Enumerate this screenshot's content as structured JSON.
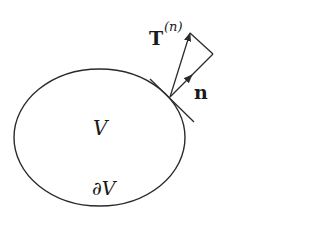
{
  "diagram": {
    "region_label": "V",
    "boundary_label": "∂V",
    "normal_label": "n",
    "traction_label": "T",
    "traction_superscript": "(n)",
    "stroke_color": "#2a2a2a",
    "background": "#ffffff",
    "elements": {
      "region": {
        "shape": "ellipse",
        "cx": 99.5,
        "cy": 137.5,
        "rx": 85.5,
        "ry": 68.5
      },
      "tangent_point": {
        "x": 170,
        "y": 97
      },
      "tangent_line": {
        "x1": 150,
        "y1": 79,
        "x2": 194,
        "y2": 122
      },
      "traction_vector": {
        "from": [
          170,
          97
        ],
        "to": [
          190,
          33
        ]
      },
      "normal_vector": {
        "from": [
          170,
          97
        ],
        "to": [
          213,
          54
        ],
        "arrow_mid": [
          190,
          77
        ]
      },
      "connector": {
        "from": [
          190,
          33
        ],
        "to": [
          213,
          54
        ]
      }
    }
  }
}
